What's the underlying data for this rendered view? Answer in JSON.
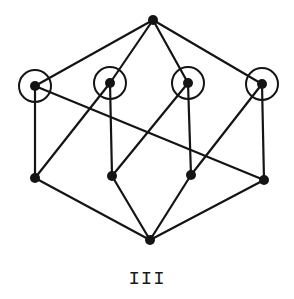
{
  "diagram": {
    "label": "III",
    "colors": {
      "ink": "#141414",
      "background": "#ffffff"
    },
    "nodes": [
      {
        "id": "top",
        "x": 153,
        "y": 20,
        "circled": false
      },
      {
        "id": "m1",
        "x": 35,
        "y": 86,
        "circled": true
      },
      {
        "id": "m2",
        "x": 110,
        "y": 83,
        "circled": true
      },
      {
        "id": "m3",
        "x": 188,
        "y": 83,
        "circled": true
      },
      {
        "id": "m4",
        "x": 262,
        "y": 84,
        "circled": true
      },
      {
        "id": "b1",
        "x": 35,
        "y": 178,
        "circled": false
      },
      {
        "id": "b2",
        "x": 112,
        "y": 176,
        "circled": false
      },
      {
        "id": "b3",
        "x": 191,
        "y": 175,
        "circled": false
      },
      {
        "id": "b4",
        "x": 264,
        "y": 180,
        "circled": false
      },
      {
        "id": "bottom",
        "x": 150,
        "y": 240,
        "circled": false
      }
    ],
    "edges": [
      [
        "top",
        "m1"
      ],
      [
        "top",
        "m2"
      ],
      [
        "top",
        "m3"
      ],
      [
        "top",
        "m4"
      ],
      [
        "m1",
        "b1"
      ],
      [
        "m1",
        "b4"
      ],
      [
        "m2",
        "b1"
      ],
      [
        "m2",
        "b2"
      ],
      [
        "m3",
        "b2"
      ],
      [
        "m3",
        "b3"
      ],
      [
        "m4",
        "b3"
      ],
      [
        "m4",
        "b4"
      ],
      [
        "b1",
        "bottom"
      ],
      [
        "b2",
        "bottom"
      ],
      [
        "b3",
        "bottom"
      ],
      [
        "b4",
        "bottom"
      ]
    ]
  }
}
